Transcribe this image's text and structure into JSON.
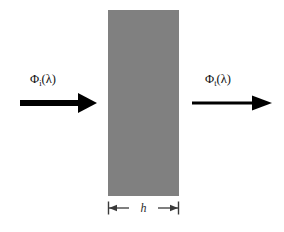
{
  "figure": {
    "background_color": "#ffffff",
    "width": 284,
    "height": 232
  },
  "slab": {
    "name": "sample-slab",
    "fill_color": "#808080",
    "x": 108,
    "y": 10,
    "width": 71,
    "height": 186
  },
  "incident": {
    "symbol": "Φ",
    "subscript": "i",
    "argument": "(λ)",
    "label": "Φi(λ)",
    "arrow_color": "#000000",
    "arrow_x_start": 20,
    "arrow_x_tip": 97,
    "arrow_y": 103,
    "shaft_thickness": 6
  },
  "transmitted": {
    "symbol": "Φ",
    "subscript": "t",
    "argument": "(λ)",
    "label": "Φt(λ)",
    "arrow_color": "#000000",
    "arrow_x_start": 192,
    "arrow_x_tip": 272,
    "arrow_y": 103,
    "shaft_thickness": 3
  },
  "dimension": {
    "label": "h",
    "line_color": "#3a3a3a",
    "y": 208,
    "x_left": 108,
    "x_right": 179,
    "tick_height": 13
  },
  "chart_data": {
    "type": "diagram",
    "elements": [
      {
        "kind": "arrow",
        "name": "incident-flux-arrow",
        "label": "Φi(λ)",
        "direction": "right",
        "from_x": 20,
        "to_x": 97,
        "y": 103,
        "weight": "thick"
      },
      {
        "kind": "rect",
        "name": "sample-slab",
        "label": "",
        "x": 108,
        "y": 10,
        "width": 71,
        "height": 186,
        "fill": "#808080"
      },
      {
        "kind": "arrow",
        "name": "transmitted-flux-arrow",
        "label": "Φt(λ)",
        "direction": "right",
        "from_x": 192,
        "to_x": 272,
        "y": 103,
        "weight": "thin"
      },
      {
        "kind": "dimension",
        "name": "thickness-dimension",
        "label": "h",
        "from_x": 108,
        "to_x": 179,
        "y": 208
      }
    ]
  }
}
